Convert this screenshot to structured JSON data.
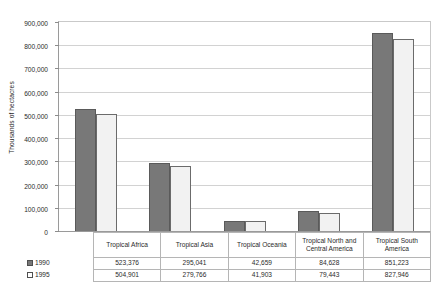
{
  "chart_data": {
    "type": "bar",
    "title": "",
    "xlabel": "",
    "ylabel": "Thousands of hectacres",
    "ylim": [
      0,
      900000
    ],
    "ytick_step": 100000,
    "grid": true,
    "legend_position": "data-table-left",
    "categories": [
      "Tropical Africa",
      "Tropical Asia",
      "Tropical Oceania",
      "Tropical North and Central America",
      "Tropical South America"
    ],
    "ytick_labels": [
      "900,000",
      "800,000",
      "700,000",
      "600,000",
      "500,000",
      "400,000",
      "300,000",
      "200,000",
      "100,000",
      "0"
    ],
    "ytick_values": [
      900000,
      800000,
      700000,
      600000,
      500000,
      400000,
      300000,
      200000,
      100000,
      0
    ],
    "series": [
      {
        "name": "1990",
        "color": "#787878",
        "values": [
          523376,
          295041,
          42659,
          84628,
          851223
        ],
        "labels": [
          "523,376",
          "295,041",
          "42,659",
          "84,628",
          "851,223"
        ]
      },
      {
        "name": "1995",
        "color": "#f2f2f2",
        "values": [
          504901,
          279766,
          41903,
          79443,
          827946
        ],
        "labels": [
          "504,901",
          "279,766",
          "41,903",
          "79,443",
          "827,946"
        ]
      }
    ]
  },
  "table": {
    "header_row": [
      "Tropical Africa",
      "Tropical Asia",
      "Tropical Oceania",
      "Tropical North and Central America",
      "Tropical South America"
    ],
    "rows": [
      {
        "label": "1990",
        "swatch": "filled-gray-square-icon",
        "values": [
          "523,376",
          "295,041",
          "42,659",
          "84,628",
          "851,223"
        ]
      },
      {
        "label": "1995",
        "swatch": "empty-white-square-icon",
        "values": [
          "504,901",
          "279,766",
          "41,903",
          "79,443",
          "827,946"
        ]
      }
    ]
  }
}
